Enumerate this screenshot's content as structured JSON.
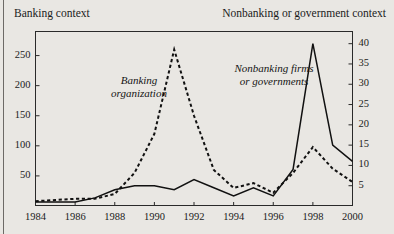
{
  "header": {
    "left_title": "Banking context",
    "right_title": "Nonbanking or government context"
  },
  "annotations": {
    "dashed_label_line1": "Banking",
    "dashed_label_line2": "organization",
    "solid_label_line1": "Nonbanking firms",
    "solid_label_line2": "or governments"
  },
  "axes": {
    "left_ticks": [
      "50",
      "100",
      "150",
      "200",
      "250"
    ],
    "right_ticks": [
      "5",
      "10",
      "15",
      "20",
      "25",
      "30",
      "35",
      "40"
    ],
    "x_ticks": [
      "1984",
      "1986",
      "1988",
      "1990",
      "1992",
      "1994",
      "1996",
      "1998",
      "2000"
    ]
  },
  "colors": {
    "background": "#e9e7e3",
    "frame": "#2a2a2a",
    "series_solid": "#111111",
    "series_dashed": "#111111",
    "text": "#1b1b1b"
  },
  "chart_data": {
    "type": "line",
    "title": "",
    "subtitle": "",
    "xlabel": "",
    "ylabel": "",
    "grid": false,
    "legend": "inline-annotations",
    "x": [
      1984,
      1985,
      1986,
      1987,
      1988,
      1989,
      1990,
      1991,
      1992,
      1993,
      1994,
      1995,
      1996,
      1997,
      1998,
      1999,
      2000
    ],
    "xlim": [
      1984,
      2000
    ],
    "left_axis": {
      "label": "Banking context",
      "ylim": [
        0,
        290
      ],
      "ticks": [
        50,
        100,
        150,
        200,
        250
      ]
    },
    "right_axis": {
      "label": "Nonbanking or government context",
      "ylim": [
        0,
        43
      ],
      "ticks": [
        5,
        10,
        15,
        20,
        25,
        30,
        35,
        40
      ]
    },
    "series": [
      {
        "name": "Banking organization",
        "style": "dashed",
        "axis": "left",
        "values": [
          8,
          10,
          12,
          12,
          20,
          55,
          120,
          260,
          150,
          60,
          30,
          38,
          22,
          55,
          98,
          62,
          40
        ]
      },
      {
        "name": "Nonbanking firms or governments",
        "style": "solid",
        "axis": "right",
        "values": [
          1,
          1,
          1,
          2,
          4,
          5,
          5,
          4,
          6.5,
          4.5,
          2.5,
          4.5,
          2.5,
          9,
          40,
          15,
          11
        ]
      }
    ]
  }
}
